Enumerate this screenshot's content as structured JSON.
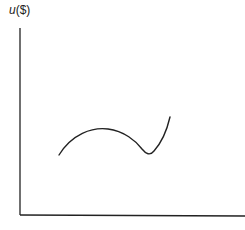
{
  "diagram": {
    "y_axis_label_var": "u",
    "y_axis_label_unit": "($)",
    "x_axis_label": "",
    "curve_description": "rises to a local maximum, dips to a local minimum, then rises steeply",
    "colors": {
      "axis": "#222222",
      "curve": "#222222",
      "background": "#ffffff"
    }
  }
}
